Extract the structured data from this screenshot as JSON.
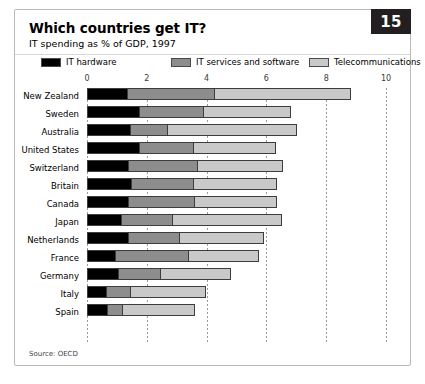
{
  "figure": {
    "number": "15",
    "title": "Which countries get IT?",
    "subtitle": "IT spending as % of GDP, 1997",
    "source": "Source: OECD"
  },
  "colors": {
    "hardware": "#000000",
    "services": "#8d8d8d",
    "telecom": "#c9c9c9",
    "badge": "#231f20",
    "frame": "#b9b9b9"
  },
  "chart_data": {
    "type": "bar",
    "orientation": "horizontal",
    "stacked": true,
    "title": "Which countries get IT?",
    "subtitle": "IT spending as % of GDP, 1997",
    "xlabel": "",
    "ylabel": "",
    "xlim": [
      0,
      10
    ],
    "xticks": [
      0,
      2,
      4,
      6,
      8,
      10
    ],
    "xtick_labels": [
      "0",
      "2",
      "4",
      "6",
      "8",
      "10"
    ],
    "grid": true,
    "legend_position": "top",
    "categories": [
      "New Zealand",
      "Sweden",
      "Australia",
      "United States",
      "Switzerland",
      "Britain",
      "Canada",
      "Japan",
      "Netherlands",
      "France",
      "Germany",
      "Italy",
      "Spain"
    ],
    "series": [
      {
        "name": "IT hardware",
        "color": "#000000",
        "values": [
          1.3,
          1.7,
          1.4,
          1.7,
          1.35,
          1.45,
          1.35,
          1.1,
          1.35,
          0.9,
          1.0,
          0.6,
          0.65
        ]
      },
      {
        "name": "IT services and software",
        "color": "#8d8d8d",
        "values": [
          2.9,
          2.15,
          1.25,
          1.8,
          2.3,
          2.05,
          2.2,
          1.7,
          1.7,
          2.45,
          1.4,
          0.8,
          0.5
        ]
      },
      {
        "name": "Telecommunications",
        "color": "#c9c9c9",
        "values": [
          4.55,
          2.9,
          4.3,
          2.75,
          2.85,
          2.8,
          2.75,
          3.65,
          2.8,
          2.35,
          2.35,
          2.5,
          2.4
        ]
      }
    ],
    "totals": [
      8.75,
      8.45,
      8.3,
      8.25,
      8.0,
      7.85,
      7.65,
      7.6,
      7.2,
      6.55,
      5.7,
      4.5,
      4.2
    ],
    "source": "Source: OECD"
  }
}
